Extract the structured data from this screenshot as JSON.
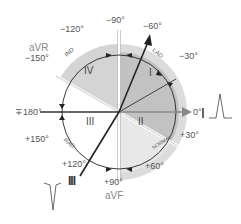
{
  "diagram": {
    "center": [
      119,
      112
    ],
    "colors": {
      "quadrant_I_dark": "#bdbdbd",
      "quadrant_IV": "#d2d2d2",
      "outer_band": "#d9d9d9",
      "quadrant_II": "#e6e6e6",
      "arc": "#222222",
      "axis_line": "#333333",
      "lead_I_arrow": "#888888",
      "lead_label": "#8a8a8a",
      "text": "#555555"
    },
    "angle_labels": {
      "m90": "−90°",
      "m60": "−60°",
      "m30": "−30°",
      "m120": "−120°",
      "m150": "−150°",
      "zero": "0°",
      "pm180": "∓180°",
      "p30": "+30°",
      "p60": "+60°",
      "p90": "+90°",
      "p120": "+120°",
      "p150": "+150°"
    },
    "quadrants": {
      "q1": "I",
      "q2": "II",
      "q3": "III",
      "q4": "IV"
    },
    "zone_labels": {
      "lad": "LAD",
      "normal": "NORMAL",
      "rad": "RAD",
      "ind": "IND"
    },
    "leads": {
      "avr": "aVR",
      "avf": "aVF",
      "lead_I": "I",
      "lead_III": "III"
    }
  }
}
